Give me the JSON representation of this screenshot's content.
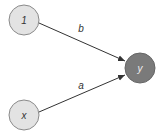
{
  "diagram": {
    "type": "computation-graph",
    "nodes": [
      {
        "id": "one",
        "label": "1",
        "role": "input",
        "fill": "#e3e3e3",
        "stroke": "#8a8a8a"
      },
      {
        "id": "x",
        "label": "x",
        "role": "input",
        "fill": "#e3e3e3",
        "stroke": "#8a8a8a"
      },
      {
        "id": "y",
        "label": "y",
        "role": "output",
        "fill": "#7a7a7a",
        "stroke": "#666666"
      }
    ],
    "edges": [
      {
        "from": "1",
        "to": "y",
        "label": "b"
      },
      {
        "from": "x",
        "to": "y",
        "label": "a"
      }
    ],
    "colors": {
      "edge": "#333333",
      "background": "#ffffff"
    }
  }
}
